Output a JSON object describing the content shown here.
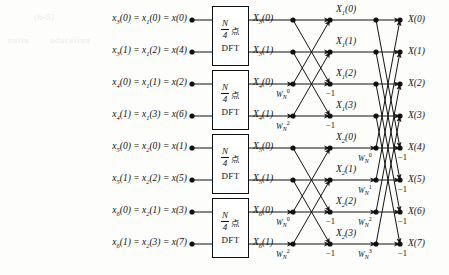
{
  "figure": {
    "type": "fft-butterfly-signal-flow-graph",
    "N": 8,
    "stages": 3,
    "background_color": "#fdfdfc",
    "line_color": "#111111",
    "node_color": "#111111"
  },
  "artifacts": [
    {
      "text": "(b-5)",
      "x": 34,
      "y": 13
    },
    {
      "text": "nutiu",
      "x": 8,
      "y": 36
    },
    {
      "text": "oducaiiun",
      "x": 50,
      "y": 36
    }
  ],
  "inputs": [
    {
      "label_html": "x<sub>3</sub>(0) = x<sub>1</sub>(0) = x(0)",
      "row": 0
    },
    {
      "label_html": "x<sub>3</sub>(1) = x<sub>1</sub>(2) = x(4)",
      "row": 1
    },
    {
      "label_html": "x<sub>4</sub>(0) = x<sub>1</sub>(1) = x(2)",
      "row": 2
    },
    {
      "label_html": "x<sub>4</sub>(1) = x<sub>1</sub>(3) = x(6)",
      "row": 3
    },
    {
      "label_html": "x<sub>5</sub>(0) = x<sub>2</sub>(0) = x(1)",
      "row": 4
    },
    {
      "label_html": "x<sub>5</sub>(1) = x<sub>2</sub>(2) = x(5)",
      "row": 5
    },
    {
      "label_html": "x<sub>6</sub>(0) = x<sub>2</sub>(1) = x(3)",
      "row": 6
    },
    {
      "label_html": "x<sub>6</sub>(1) = x<sub>2</sub>(3) = x(7)",
      "row": 7
    }
  ],
  "dft_boxes": [
    {
      "line1_numerator": "N",
      "line1_denominator": "4",
      "line1_suffix": "点",
      "line2": "DFT",
      "rows": [
        0,
        1
      ]
    },
    {
      "line1_numerator": "N",
      "line1_denominator": "4",
      "line1_suffix": "点",
      "line2": "DFT",
      "rows": [
        2,
        3
      ]
    },
    {
      "line1_numerator": "N",
      "line1_denominator": "4",
      "line1_suffix": "点",
      "line2": "DFT",
      "rows": [
        4,
        5
      ]
    },
    {
      "line1_numerator": "N",
      "line1_denominator": "4",
      "line1_suffix": "点",
      "line2": "DFT",
      "rows": [
        6,
        7
      ]
    }
  ],
  "stage1_outputs": [
    {
      "label_html": "X<sub>3</sub>(0)",
      "row": 0
    },
    {
      "label_html": "X<sub>3</sub>(1)",
      "row": 1
    },
    {
      "label_html": "X<sub>4</sub>(0)",
      "row": 2
    },
    {
      "label_html": "X<sub>4</sub>(1)",
      "row": 3
    },
    {
      "label_html": "X<sub>5</sub>(0)",
      "row": 4
    },
    {
      "label_html": "X<sub>5</sub>(1)",
      "row": 5
    },
    {
      "label_html": "X<sub>6</sub>(0)",
      "row": 6
    },
    {
      "label_html": "X<sub>6</sub>(1)",
      "row": 7
    }
  ],
  "stage2_outputs": [
    {
      "label_html": "X<sub>1</sub>(0)",
      "row": 0
    },
    {
      "label_html": "X<sub>1</sub>(1)",
      "row": 1
    },
    {
      "label_html": "X<sub>1</sub>(2)",
      "row": 2
    },
    {
      "label_html": "X<sub>1</sub>(3)",
      "row": 3
    },
    {
      "label_html": "X<sub>2</sub>(0)",
      "row": 4
    },
    {
      "label_html": "X<sub>2</sub>(1)",
      "row": 5
    },
    {
      "label_html": "X<sub>2</sub>(2)",
      "row": 6
    },
    {
      "label_html": "X<sub>2</sub>(3)",
      "row": 7
    }
  ],
  "outputs": [
    {
      "label_html": "X(0)",
      "row": 0
    },
    {
      "label_html": "X(1)",
      "row": 1
    },
    {
      "label_html": "X(2)",
      "row": 2
    },
    {
      "label_html": "X(3)",
      "row": 3
    },
    {
      "label_html": "X(4)",
      "row": 4
    },
    {
      "label_html": "X(5)",
      "row": 5
    },
    {
      "label_html": "X(6)",
      "row": 6
    },
    {
      "label_html": "X(7)",
      "row": 7
    }
  ],
  "stage2_twiddles": [
    {
      "base": "W",
      "sub": "N",
      "sup": "0",
      "row": 2
    },
    {
      "base": "W",
      "sub": "N",
      "sup": "2",
      "row": 3
    },
    {
      "base": "W",
      "sub": "N",
      "sup": "0",
      "row": 6
    },
    {
      "base": "W",
      "sub": "N",
      "sup": "2",
      "row": 7
    }
  ],
  "stage3_twiddles": [
    {
      "base": "W",
      "sub": "N",
      "sup": "0",
      "row": 4
    },
    {
      "base": "W",
      "sub": "N",
      "sup": "1",
      "row": 5
    },
    {
      "base": "W",
      "sub": "N",
      "sup": "2",
      "row": 6
    },
    {
      "base": "W",
      "sub": "N",
      "sup": "3",
      "row": 7
    }
  ],
  "stage2_minus_ones": [
    {
      "text": "−1",
      "row": 2
    },
    {
      "text": "−1",
      "row": 3
    },
    {
      "text": "−1",
      "row": 6
    },
    {
      "text": "−1",
      "row": 7
    }
  ],
  "stage3_minus_ones": [
    {
      "text": "−1",
      "row": 4
    },
    {
      "text": "−1",
      "row": 5
    },
    {
      "text": "−1",
      "row": 6
    },
    {
      "text": "−1",
      "row": 7
    }
  ],
  "geometry": {
    "row_y": [
      20,
      52,
      84,
      116,
      148,
      180,
      212,
      244
    ],
    "input_dot_x": 192,
    "box_left": 212,
    "box_right": 249,
    "stage2_in_x": 293,
    "stage2_out_x": 330,
    "stage3_in_x": 376,
    "stage3_out_x": 400,
    "output_label_x": 408
  }
}
